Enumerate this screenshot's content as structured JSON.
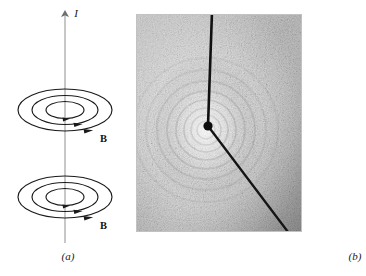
{
  "figure": {
    "domain_note": "physics textbook figure: magnetic field around a current-carrying wire",
    "background_color": "#ffffff",
    "ink_color": "#1a1a1a"
  },
  "panel_a": {
    "caption": "(a)",
    "current_label": "I",
    "field_label_upper": "B",
    "field_label_lower": "B",
    "axis": {
      "name": "current-carrying wire",
      "x": 65,
      "y_top": 12,
      "y_bottom": 243,
      "arrow_direction": "up",
      "color": "#8a8a8a"
    },
    "coils": [
      {
        "name": "upper-field-loops",
        "center_x": 65,
        "center_y": 110,
        "rings": [
          {
            "rx": 47,
            "ry": 21
          },
          {
            "rx": 33,
            "ry": 14.5
          },
          {
            "rx": 19,
            "ry": 8.5
          }
        ],
        "arrow_side": "right-front",
        "sense": "counterclockwise-from-above"
      },
      {
        "name": "lower-field-loops",
        "center_x": 65,
        "center_y": 197,
        "rings": [
          {
            "rx": 47,
            "ry": 21
          },
          {
            "rx": 33,
            "ry": 14.5
          },
          {
            "rx": 19,
            "ry": 8.5
          }
        ],
        "arrow_side": "right-front",
        "sense": "counterclockwise-from-above"
      }
    ]
  },
  "panel_b": {
    "caption": "(b)",
    "photo": {
      "name": "iron-filings-photograph",
      "description": "iron filings on a plane pierced by a current-carrying wire, showing concentric circular field pattern",
      "frame": {
        "x": 136,
        "y": 14,
        "width": 166,
        "height": 218
      },
      "base_color": "#d8d8d8",
      "filing_color": "#3b3b3b",
      "wire_color": "#101010",
      "wire": {
        "segment_vertical": {
          "x1": 76,
          "y1": 2,
          "x2": 72,
          "y2": 112
        },
        "segment_diagonal": {
          "x1": 72,
          "y1": 112,
          "x2": 152,
          "y2": 216
        },
        "pierce_point": {
          "x": 72,
          "y": 112,
          "radius": 4.5
        }
      },
      "ring_center": {
        "x": 70,
        "y": 116
      }
    }
  }
}
